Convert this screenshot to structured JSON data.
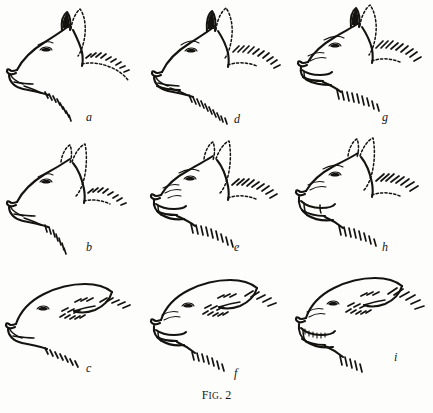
{
  "figure": {
    "caption_prefix": "F",
    "caption_small": "IG",
    "caption_rest": ". 2",
    "caption_full": "Fig. 2",
    "background_color": "#fdfdfc",
    "ink_color": "#15130f",
    "rows": 3,
    "columns": 3
  },
  "panels": [
    {
      "id": "a",
      "label": "a",
      "row": 1,
      "column": 1,
      "ears": "erect-forward",
      "mouth": "closed",
      "neck_hackles": "short",
      "description": "neutral alert expression, ears pricked forward, mouth closed"
    },
    {
      "id": "d",
      "label": "d",
      "row": 1,
      "column": 2,
      "ears": "erect-forward",
      "mouth": "closed",
      "neck_hackles": "medium",
      "description": "increasing aggression, ears forward, lips beginning to tense"
    },
    {
      "id": "g",
      "label": "g",
      "row": 1,
      "column": 3,
      "ears": "erect-forward",
      "mouth": "open-snarl",
      "neck_hackles": "long",
      "description": "full aggression, ears forward, mouth open in snarl, hackles raised"
    },
    {
      "id": "b",
      "label": "b",
      "row": 2,
      "column": 1,
      "ears": "half-back",
      "mouth": "closed",
      "neck_hackles": "short",
      "description": "mild apprehension, ears turned partly back, mouth closed"
    },
    {
      "id": "e",
      "label": "e",
      "row": 2,
      "column": 2,
      "ears": "half-back",
      "mouth": "open-snarl",
      "neck_hackles": "medium",
      "description": "mixed fear and aggression, ears half back, mouth open, muzzle wrinkled"
    },
    {
      "id": "h",
      "label": "h",
      "row": 2,
      "column": 3,
      "ears": "half-back",
      "mouth": "wide-open-snarl",
      "neck_hackles": "long",
      "description": "strong conflict, ears half back, wide snarl showing teeth"
    },
    {
      "id": "c",
      "label": "c",
      "row": 3,
      "column": 1,
      "ears": "flattened-back",
      "mouth": "closed",
      "neck_hackles": "short",
      "description": "submissive fear, ears flattened against head, mouth closed"
    },
    {
      "id": "f",
      "label": "f",
      "row": 3,
      "column": 2,
      "ears": "flattened-back",
      "mouth": "open",
      "neck_hackles": "medium",
      "description": "fearful defensive, ears flat, mouth open, muzzle wrinkled"
    },
    {
      "id": "i",
      "label": "i",
      "row": 3,
      "column": 3,
      "ears": "flattened-back",
      "mouth": "wide-open-teeth",
      "neck_hackles": "long",
      "description": "maximum fear and aggression, ears flat back, teeth fully bared"
    }
  ]
}
